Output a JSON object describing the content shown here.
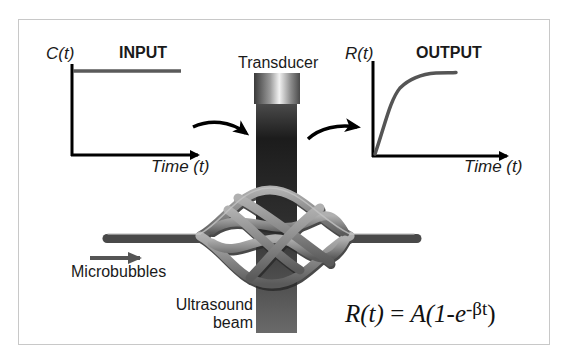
{
  "figure": {
    "frame_color": "#c8c8c8",
    "input_chart": {
      "title": "INPUT",
      "y_label": "C(t)",
      "x_label": "Time (t)",
      "curve": "step (constant)"
    },
    "output_chart": {
      "title": "OUTPUT",
      "y_label": "R(t)",
      "x_label": "Time (t)",
      "curve": "exponential rise to plateau"
    },
    "labels": {
      "transducer": "Transducer",
      "microbubbles": "Microbubbles",
      "ultrasound_line1": "Ultrasound",
      "ultrasound_line2": "beam"
    },
    "equation": {
      "lhs": "R(t)",
      "eq": " = ",
      "rhs_pre": "A(1-e",
      "exponent": "-βt",
      "rhs_post": ")"
    },
    "colors": {
      "axis": "#000000",
      "signal": "#555555",
      "vessel": "#8a8a8a",
      "beam_dark": "#1a1a1a",
      "beam_light": "#5a5a5a"
    }
  }
}
